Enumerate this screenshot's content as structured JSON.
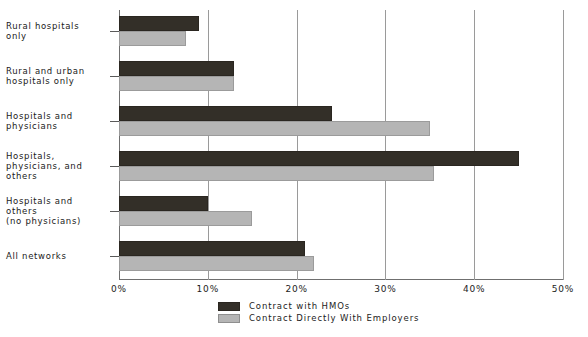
{
  "chart_data": {
    "type": "bar",
    "orientation": "horizontal",
    "title": "",
    "xlabel": "",
    "ylabel": "",
    "xlim": [
      0,
      50
    ],
    "xticks": [
      "0%",
      "10%",
      "20%",
      "30%",
      "40%",
      "50%"
    ],
    "xtick_values": [
      0,
      10,
      20,
      30,
      40,
      50
    ],
    "grid": true,
    "legend_position": "bottom-center",
    "categories": [
      "Rural hospitals\nonly",
      "Rural and urban\nhospitals only",
      "Hospitals and\nphysicians",
      "Hospitals,\nphysicians, and\nothers",
      "Hospitals and\nothers\n(no physicians)",
      "All networks"
    ],
    "series": [
      {
        "name": "Contract with HMOs",
        "color": "#332f28",
        "values": [
          9,
          13,
          24,
          45,
          10,
          21
        ]
      },
      {
        "name": "Contract Directly With Employers",
        "color": "#b5b5b5",
        "values": [
          7.5,
          13,
          35,
          35.5,
          15,
          22
        ]
      }
    ]
  },
  "legend": {
    "items": [
      {
        "label": "Contract with HMOs",
        "swatch": "dark"
      },
      {
        "label": "Contract Directly With Employers",
        "swatch": "light"
      }
    ]
  }
}
